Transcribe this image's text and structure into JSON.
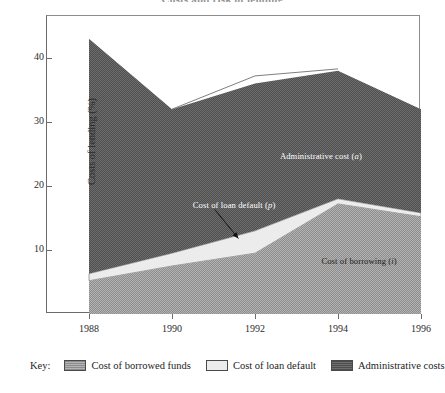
{
  "title": "Costs and risk of lending",
  "axes": {
    "y_label": "Costs of lending (%)",
    "y_ticks": [
      10,
      20,
      30,
      40
    ],
    "x_ticks": [
      1988,
      1990,
      1992,
      1994,
      1996
    ]
  },
  "annotations": {
    "administrative": "Administrative cost (",
    "administrative_sym": "a",
    "default": "Cost of loan default (",
    "default_sym": "p",
    "borrowing": "Cost of borrowing (",
    "borrowing_sym": "i",
    "paren_close": ")"
  },
  "legend": {
    "key_label": "Key:",
    "items": [
      {
        "label": "Cost of borrowed funds",
        "color": "#a0a0a0"
      },
      {
        "label": "Cost of loan default",
        "color": "#ececec"
      },
      {
        "label": "Administrative costs",
        "color": "#5e5e5e"
      }
    ]
  },
  "colors": {
    "borrowed_funds": "#a0a0a0",
    "loan_default": "#ececec",
    "administrative": "#5e5e5e",
    "axis": "#6b6b6b",
    "outline": "#ffffff"
  },
  "chart_data": {
    "type": "area",
    "title": "Costs and risk of lending",
    "xlabel": "",
    "ylabel": "Costs of lending (%)",
    "x": [
      1988,
      1990,
      1992,
      1994,
      1996
    ],
    "xlim": [
      1988,
      1996
    ],
    "ylim": [
      0,
      46.5
    ],
    "grid": false,
    "stacked": true,
    "legend_position": "below",
    "series": [
      {
        "name": "Cost of borrowed funds",
        "key": "i",
        "color": "#a0a0a0",
        "cumulative_top": [
          5.2,
          7.5,
          9.5,
          17.2,
          15.2
        ],
        "values": [
          5.2,
          7.5,
          9.5,
          17.2,
          15.2
        ]
      },
      {
        "name": "Cost of loan default",
        "key": "p",
        "color": "#ececec",
        "cumulative_top": [
          6.3,
          9.5,
          13.0,
          18.0,
          15.8
        ],
        "values": [
          1.1,
          2.0,
          3.5,
          0.8,
          0.6
        ]
      },
      {
        "name": "Administrative costs",
        "key": "a",
        "color": "#5e5e5e",
        "cumulative_top": [
          43.0,
          32.0,
          36.0,
          38.0,
          32.0
        ],
        "values": [
          36.7,
          22.5,
          23.0,
          20.0,
          16.2
        ]
      }
    ],
    "outline_line": {
      "name": "total cost outline",
      "x": [
        1990,
        1992,
        1994
      ],
      "values": [
        32.0,
        37.2,
        38.3
      ]
    },
    "annotations": [
      {
        "text": "Administrative cost (a)",
        "x": 1992.6,
        "y": 24.5
      },
      {
        "text": "Cost of loan default (p)",
        "x": 1990.5,
        "y": 16.8,
        "arrow_to": {
          "x": 1991.6,
          "y": 11.8
        }
      },
      {
        "text": "Cost of borrowing (i)",
        "x": 1993.6,
        "y": 8.2
      }
    ]
  }
}
